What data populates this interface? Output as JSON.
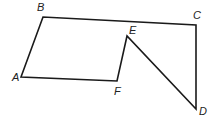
{
  "diagram": {
    "type": "polygon",
    "stroke_color": "#1a1a1a",
    "vertices": [
      {
        "id": "A",
        "label": "A",
        "x": 21,
        "y": 77,
        "lx": 12,
        "ly": 81
      },
      {
        "id": "B",
        "label": "B",
        "x": 43,
        "y": 17,
        "lx": 37,
        "ly": 11
      },
      {
        "id": "C",
        "label": "C",
        "x": 196,
        "y": 25,
        "lx": 193,
        "ly": 19
      },
      {
        "id": "D",
        "label": "D",
        "x": 196,
        "y": 109,
        "lx": 199,
        "ly": 115
      },
      {
        "id": "E",
        "label": "E",
        "x": 127,
        "y": 36,
        "lx": 129,
        "ly": 34
      },
      {
        "id": "F",
        "label": "F",
        "x": 117,
        "y": 81,
        "lx": 114,
        "ly": 95
      }
    ],
    "edges": [
      [
        "A",
        "B"
      ],
      [
        "B",
        "C"
      ],
      [
        "C",
        "D"
      ],
      [
        "D",
        "E"
      ],
      [
        "E",
        "F"
      ],
      [
        "F",
        "A"
      ]
    ]
  }
}
